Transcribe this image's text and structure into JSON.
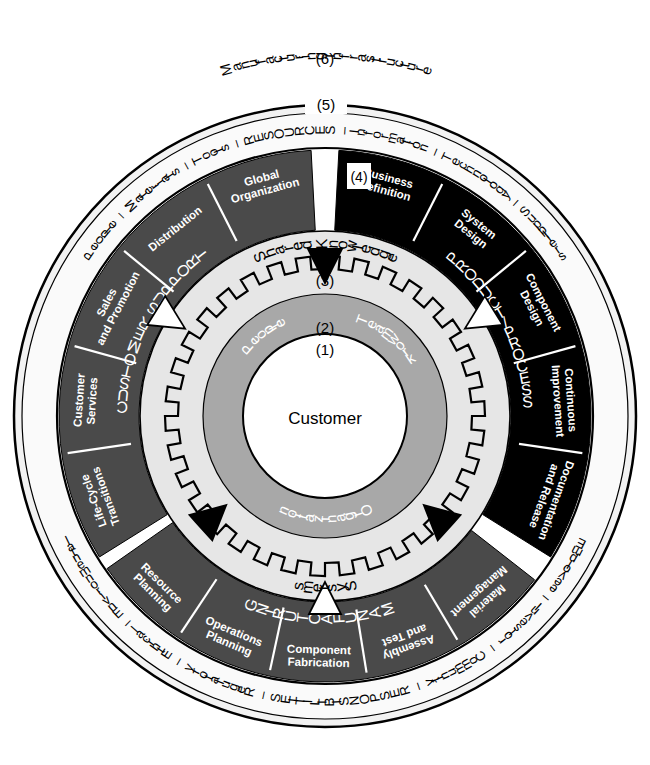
{
  "diagram": {
    "center": {
      "marker": "(1)",
      "label": "Customer"
    },
    "inner_ring": {
      "marker": "(2)",
      "labels": [
        "People",
        "Teamwork",
        "Organization"
      ]
    },
    "integration_ring": {
      "marker": "(3)",
      "labels": [
        "Shared Knowledge",
        "Systems"
      ]
    },
    "function_ring": {
      "marker": "(4)",
      "sectors": [
        {
          "name": "CUSTOMER SUPPORT",
          "fill": "#4a4a4a",
          "text_color": "#ffffff",
          "segments": [
            "Life-Cycle Transitions",
            "Customer Services",
            "Sales and Promotion",
            "Distribution",
            "Global Organization"
          ]
        },
        {
          "name": "PRODUCT/PROCESS",
          "fill": "#000000",
          "text_color": "#ffffff",
          "segments": [
            "Business Definition",
            "System Design",
            "Component Design",
            "Continuous Improvement",
            "Documentation and Release"
          ]
        },
        {
          "name": "MANUFACTURING",
          "fill": "#4a4a4a",
          "text_color": "#ffffff",
          "segments": [
            "Material Management",
            "Assembly and Test",
            "Component Fabrication",
            "Operations Planning",
            "Resource Planning"
          ]
        }
      ]
    },
    "resources_ring": {
      "marker": "(5)",
      "top_label": "People – Materials – Tools – RESOURCES – Information – Technology – Suppliers",
      "bottom_label": "Employee – Investor – Community – RESPONSIBILITIES – Regulatory – Ethical – Environmental",
      "top_words": [
        "People",
        "–",
        "Materials",
        "–",
        "Tools",
        "–",
        "RESOURCES",
        "–",
        "Information",
        "–",
        "Technology",
        "–",
        "Suppliers"
      ],
      "bottom_words": [
        "Employee",
        "–",
        "Investor",
        "–",
        "Community",
        "–",
        "RESPONSIBILITIES",
        "–",
        "Regulatory",
        "–",
        "Ethical",
        "–",
        "Environmental"
      ]
    },
    "outer_label": {
      "marker": "(6)",
      "label": "Manufacturing Infrastructure"
    },
    "colors": {
      "black": "#000000",
      "dark_gray": "#4a4a4a",
      "mid_gray": "#a8a8a8",
      "light_gray": "#e3e3e3",
      "pale": "#efefef",
      "white": "#ffffff"
    }
  }
}
